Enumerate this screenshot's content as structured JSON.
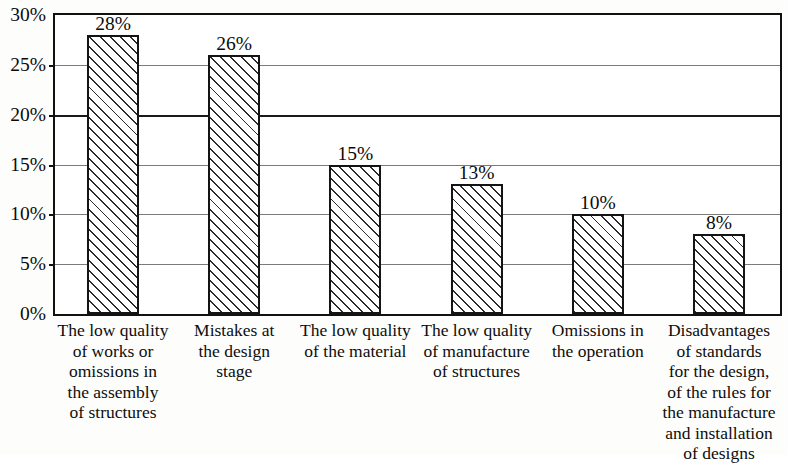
{
  "chart_data": {
    "type": "bar",
    "title": "",
    "subtitle": "",
    "xlabel": "",
    "ylabel": "",
    "ylim": [
      0,
      30
    ],
    "ytick_values": [
      30,
      25,
      20,
      15,
      10,
      5,
      0
    ],
    "ytick_labels": [
      "30%",
      "25%",
      "20%",
      "15%",
      "10%",
      "5%",
      "0%"
    ],
    "grid": true,
    "legend": null,
    "categories": [
      "The low quality\nof  works or\nomissions in\nthe assembly\nof structures",
      "Mistakes at\nthe design\nstage",
      "The low quality\nof the material",
      "The low quality\nof manufacture\nof structures",
      "Omissions in\nthe operation",
      "Disadvantages\nof standards\nfor the design,\nof the rules for\nthe manufacture\nand installation\nof designs"
    ],
    "values": [
      28,
      26,
      15,
      13,
      10,
      8
    ],
    "value_labels": [
      "28%",
      "26%",
      "15%",
      "13%",
      "10%",
      "8%"
    ],
    "bar_style": {
      "fill": "#ffffff",
      "hatch": "diagonal-forward",
      "edge_color": "#141414"
    },
    "axis_color": "#111111",
    "gridline_color": "#7b7b7b"
  }
}
